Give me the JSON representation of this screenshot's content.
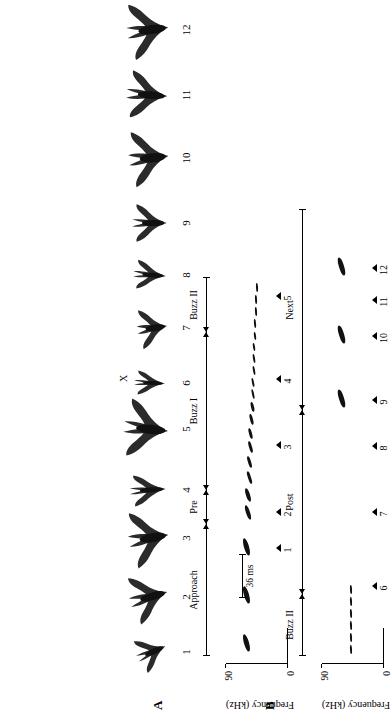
{
  "figure": {
    "panels": [
      {
        "letter": "A",
        "name": "flight-photo-sequence"
      },
      {
        "letter": "B",
        "name": "echolocation-spectrograms"
      }
    ]
  },
  "panelA": {
    "letter": "A",
    "frames": [
      {
        "number": "1",
        "x": 44,
        "w": 40,
        "h": 44,
        "rot": -24,
        "scale": 0.92
      },
      {
        "number": "2",
        "x": 94,
        "w": 50,
        "h": 50,
        "rot": -16,
        "scale": 1.02
      },
      {
        "number": "3",
        "x": 150,
        "w": 56,
        "h": 50,
        "rot": -10,
        "scale": 1.06
      },
      {
        "number": "4",
        "x": 208,
        "w": 36,
        "h": 52,
        "rot": -4,
        "scale": 0.92
      },
      {
        "number": "5",
        "x": 258,
        "w": 58,
        "h": 56,
        "rot": 6,
        "scale": 1.05
      },
      {
        "number": "6",
        "x": 318,
        "w": 30,
        "h": 48,
        "rot": 2,
        "scale": 0.85
      },
      {
        "number": "7",
        "x": 366,
        "w": 44,
        "h": 42,
        "rot": -8,
        "scale": 0.95
      },
      {
        "number": "8",
        "x": 424,
        "w": 34,
        "h": 48,
        "rot": 4,
        "scale": 0.9
      },
      {
        "number": "9",
        "x": 472,
        "w": 42,
        "h": 48,
        "rot": 0,
        "scale": 0.95
      },
      {
        "number": "10",
        "x": 530,
        "w": 56,
        "h": 50,
        "rot": -6,
        "scale": 1.05
      },
      {
        "number": "11",
        "x": 596,
        "w": 50,
        "h": 54,
        "rot": 4,
        "scale": 1.0
      },
      {
        "number": "12",
        "x": 658,
        "w": 56,
        "h": 52,
        "rot": -8,
        "scale": 1.06
      }
    ],
    "annotation_x": {
      "label": "X",
      "x": 334,
      "y": 118
    }
  },
  "panelB": {
    "letter": "B",
    "axis": {
      "ylabel": "Frequency (kHz)",
      "ytop": "90",
      "ybottom": "0",
      "ymin": 0,
      "ymax": 90
    },
    "scalebar": {
      "label": "36 ms",
      "x": 118,
      "y": 46,
      "width": 44
    },
    "rows": [
      {
        "name": "row-upper",
        "phases": [
          {
            "label": "Approach",
            "x": 60,
            "width": 132,
            "cap_left": true,
            "cap_right": false,
            "arrow_right": true
          },
          {
            "label": "Pre",
            "x": 192,
            "width": 34,
            "cap_left": false,
            "cap_right": false,
            "arrow_left": true,
            "arrow_right": true
          },
          {
            "label": "Buzz I",
            "x": 226,
            "width": 158,
            "cap_left": false,
            "cap_right": false,
            "arrow_left": true,
            "arrow_right": true
          },
          {
            "label": "Buzz II",
            "x": 384,
            "width": 54,
            "cap_left": false,
            "cap_right": true,
            "arrow_left": true
          }
        ],
        "calls": [
          {
            "x": 64,
            "y": 40,
            "w": 18,
            "h": 4.5,
            "rot": -16
          },
          {
            "x": 112,
            "y": 40,
            "w": 18,
            "h": 4.5,
            "rot": -16
          },
          {
            "x": 160,
            "y": 40,
            "w": 18,
            "h": 4.5,
            "rot": -16
          },
          {
            "x": 196,
            "y": 38,
            "w": 15,
            "h": 4.0,
            "rot": -18
          },
          {
            "x": 214,
            "y": 38,
            "w": 14,
            "h": 3.8,
            "rot": -18
          },
          {
            "x": 232,
            "y": 37,
            "w": 13,
            "h": 3.4,
            "rot": -18
          },
          {
            "x": 248,
            "y": 37,
            "w": 12,
            "h": 3.2,
            "rot": -17
          },
          {
            "x": 263,
            "y": 36,
            "w": 12,
            "h": 3.0,
            "rot": -16
          },
          {
            "x": 277,
            "y": 36,
            "w": 11,
            "h": 2.8,
            "rot": -15
          },
          {
            "x": 291,
            "y": 35,
            "w": 11,
            "h": 2.6,
            "rot": -14
          },
          {
            "x": 304,
            "y": 35,
            "w": 10,
            "h": 2.5,
            "rot": -13
          },
          {
            "x": 317,
            "y": 34,
            "w": 10,
            "h": 2.4,
            "rot": -12
          },
          {
            "x": 329,
            "y": 34,
            "w": 9,
            "h": 2.3,
            "rot": -11
          },
          {
            "x": 341,
            "y": 33,
            "w": 9,
            "h": 2.2,
            "rot": -10
          },
          {
            "x": 353,
            "y": 33,
            "w": 9,
            "h": 2.1,
            "rot": -9
          },
          {
            "x": 365,
            "y": 33,
            "w": 8,
            "h": 2.0,
            "rot": -8
          },
          {
            "x": 376,
            "y": 32,
            "w": 8,
            "h": 2.0,
            "rot": -7
          },
          {
            "x": 388,
            "y": 32,
            "w": 9,
            "h": 2.0,
            "rot": -5
          },
          {
            "x": 400,
            "y": 31,
            "w": 9,
            "h": 2.0,
            "rot": -4
          },
          {
            "x": 412,
            "y": 31,
            "w": 9,
            "h": 2.0,
            "rot": -3
          },
          {
            "x": 424,
            "y": 30,
            "w": 9,
            "h": 2.0,
            "rot": -3
          }
        ],
        "markers": [
          {
            "number": "1",
            "x": 160
          },
          {
            "number": "2",
            "x": 196
          },
          {
            "number": "3",
            "x": 263
          },
          {
            "number": "4",
            "x": 329
          },
          {
            "number": "5",
            "x": 412
          }
        ]
      },
      {
        "name": "row-lower",
        "phases": [
          {
            "label": "Buzz II",
            "x": 60,
            "width": 62,
            "cap_left": true,
            "cap_right": false,
            "arrow_right": true
          },
          {
            "label": "Post",
            "x": 122,
            "width": 184,
            "cap_left": false,
            "cap_right": false,
            "arrow_left": true,
            "arrow_right": true
          },
          {
            "label": "Next",
            "x": 306,
            "width": 200,
            "cap_left": false,
            "cap_right": true,
            "arrow_left": true
          }
        ],
        "calls": [
          {
            "x": 62,
            "y": 32,
            "w": 9,
            "h": 2.0,
            "rot": -3
          },
          {
            "x": 74,
            "y": 32,
            "w": 9,
            "h": 2.0,
            "rot": -3
          },
          {
            "x": 86,
            "y": 32,
            "w": 9,
            "h": 2.0,
            "rot": -3
          },
          {
            "x": 98,
            "y": 32,
            "w": 9,
            "h": 2.0,
            "rot": -3
          },
          {
            "x": 110,
            "y": 32,
            "w": 9,
            "h": 2.0,
            "rot": -3
          },
          {
            "x": 122,
            "y": 32,
            "w": 9,
            "h": 2.0,
            "rot": -3
          },
          {
            "x": 308,
            "y": 40,
            "w": 19,
            "h": 5.0,
            "rot": -17
          },
          {
            "x": 372,
            "y": 40,
            "w": 19,
            "h": 5.0,
            "rot": -17
          },
          {
            "x": 440,
            "y": 40,
            "w": 19,
            "h": 5.0,
            "rot": -17
          }
        ],
        "markers": [
          {
            "number": "6",
            "x": 122
          },
          {
            "number": "7",
            "x": 196
          },
          {
            "number": "8",
            "x": 262
          },
          {
            "number": "9",
            "x": 308
          },
          {
            "number": "10",
            "x": 372
          },
          {
            "number": "11",
            "x": 408
          },
          {
            "number": "12",
            "x": 440
          }
        ]
      }
    ]
  }
}
